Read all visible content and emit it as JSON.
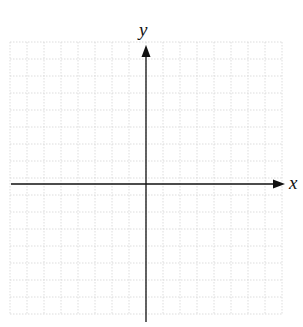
{
  "diagram": {
    "type": "coordinate-plane",
    "x_axis_label": "x",
    "y_axis_label": "y",
    "grid": {
      "columns": 16,
      "rows": 16,
      "cell_size_px": 17,
      "left": 10,
      "top": 42,
      "line_style": "dotted",
      "line_color": "#d4d4d4"
    },
    "axes": {
      "color": "#111111",
      "origin_px": [
        146,
        184
      ],
      "x_axis": {
        "start": 11,
        "end": 285
      },
      "y_axis": {
        "start": 45,
        "end": 322
      }
    }
  }
}
